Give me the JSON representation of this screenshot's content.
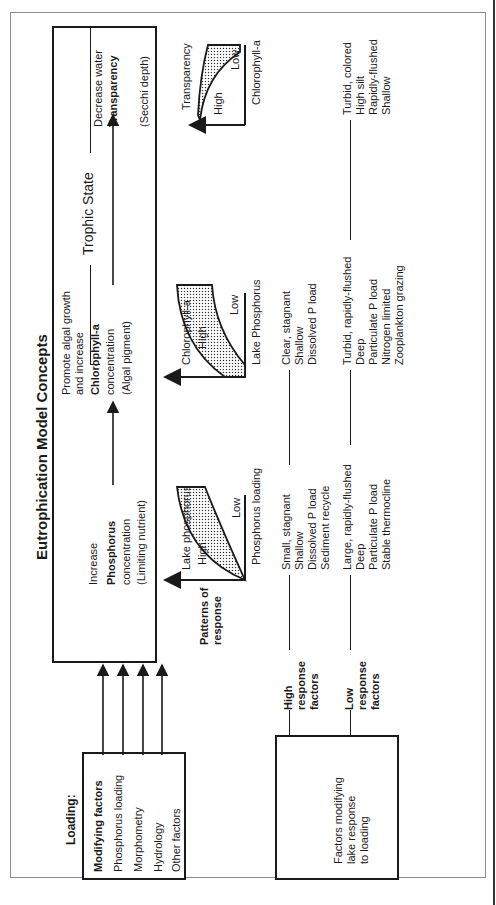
{
  "figure": {
    "title": "Eutrophication Model Concepts",
    "trophic_state_label": "Trophic State"
  },
  "loading_box": {
    "heading": "Loading:",
    "subheading": "Modifying factors",
    "items": [
      "Phosphorus loading",
      "Morphometry",
      "Hydrology",
      "Other factors"
    ]
  },
  "chain": {
    "phosphorus": {
      "line1": "Increase",
      "line2": "Phosphorus",
      "line3": "concentration",
      "line4": "(Limiting nutrient)"
    },
    "chlorophyll": {
      "line1": "Promote algal growth",
      "line2": "and increase",
      "line3": "Chlorophyll-a",
      "line4": "concentration",
      "line5": "(Algal pigment)"
    },
    "transparency": {
      "line1": "Decrease water",
      "line2": "Transparency",
      "line3": "(Secchi depth)"
    }
  },
  "patterns": {
    "label_line1": "Patterns of",
    "label_line2": "response",
    "plots": [
      {
        "y_axis": "Lake phosphorus",
        "x_axis": "Phosphorus loading",
        "high": "High",
        "low": "Low"
      },
      {
        "y_axis": "Chlorophyll-a",
        "x_axis": "Lake Phosphorus",
        "high": "High",
        "low": "Low"
      },
      {
        "y_axis": "Transparency",
        "x_axis": "Chlorophyll-a",
        "high": "High",
        "low": "Low"
      }
    ]
  },
  "response_factors": {
    "high": {
      "label": [
        "High",
        "response",
        "factors"
      ],
      "col1": [
        "Small, stagnant",
        "Shallow",
        "Dissolved P load",
        "Sediment recycle"
      ],
      "col2": [
        "Clear, stagnant",
        "Shallow",
        "Dissolved P load"
      ]
    },
    "low": {
      "label": [
        "Low",
        "response",
        "factors"
      ],
      "col1": [
        "Large, rapidly-flushed",
        "Deep",
        "Particulate P load",
        "Stable thermocline"
      ],
      "col2": [
        "Turbid, rapidly-flushed",
        "Deep",
        "Particulate P load",
        "Nitrogen limited",
        "Zooplankton grazing"
      ],
      "col3": [
        "Turbid, colored",
        "High silt",
        "Rapidly-flushed",
        "Shallow"
      ]
    }
  },
  "modifying_box": {
    "line1": "Factors modifying",
    "line2": "lake response",
    "line3": "to loading"
  }
}
